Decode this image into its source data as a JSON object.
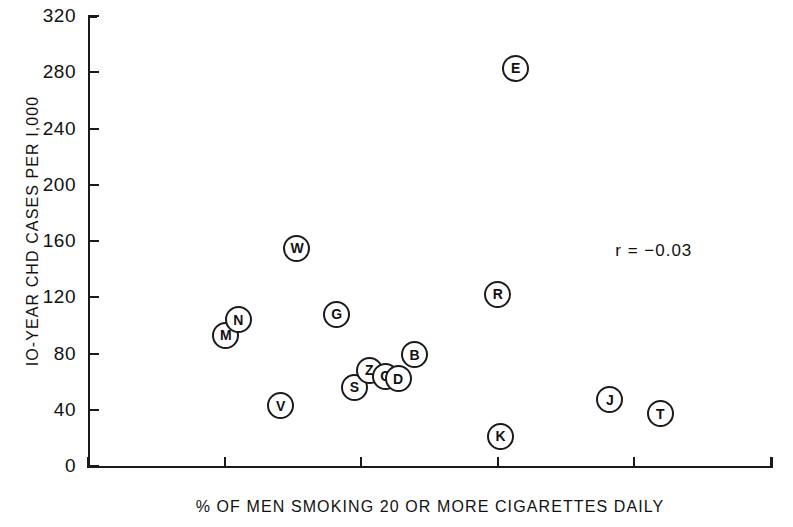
{
  "chart_data": {
    "type": "scatter",
    "title": "",
    "xlabel": "% OF MEN SMOKING 20 OR MORE CIGARETTES DAILY",
    "ylabel": "IO-YEAR CHD CASES PER I,000",
    "xlim": [
      0,
      50
    ],
    "ylim": [
      0,
      320
    ],
    "xticks": [
      "0",
      "10",
      "20",
      "30",
      "40",
      "50"
    ],
    "xtick_values": [
      0,
      10,
      20,
      30,
      40,
      50
    ],
    "yticks": [
      "0",
      "40",
      "80",
      "120",
      "160",
      "200",
      "240",
      "280",
      "320"
    ],
    "ytick_values": [
      0,
      40,
      80,
      120,
      160,
      200,
      240,
      280,
      320
    ],
    "grid": false,
    "legend": "none",
    "marker_style": "circled-letter",
    "annotations": [
      {
        "name": "correlation-annotation",
        "text": "r = −0.03",
        "x": 38.6,
        "y": 153
      }
    ],
    "points": [
      {
        "label": "M",
        "x": 10.1,
        "y": 93
      },
      {
        "label": "N",
        "x": 11.0,
        "y": 104
      },
      {
        "label": "W",
        "x": 15.3,
        "y": 155
      },
      {
        "label": "V",
        "x": 14.1,
        "y": 43
      },
      {
        "label": "G",
        "x": 18.2,
        "y": 108
      },
      {
        "label": "S",
        "x": 19.5,
        "y": 56
      },
      {
        "label": "Z",
        "x": 20.6,
        "y": 68
      },
      {
        "label": "G",
        "x": 21.8,
        "y": 64
      },
      {
        "label": "D",
        "x": 22.7,
        "y": 62
      },
      {
        "label": "B",
        "x": 23.9,
        "y": 79
      },
      {
        "label": "K",
        "x": 30.2,
        "y": 21
      },
      {
        "label": "E",
        "x": 31.3,
        "y": 283
      },
      {
        "label": "R",
        "x": 30.0,
        "y": 122
      },
      {
        "label": "J",
        "x": 38.2,
        "y": 47
      },
      {
        "label": "T",
        "x": 41.9,
        "y": 37
      }
    ]
  }
}
